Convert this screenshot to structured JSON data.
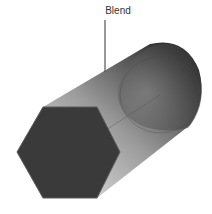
{
  "diagram": {
    "callout_label": "Blend",
    "colors": {
      "background": "#ffffff",
      "hexagon_face": "#3a3a3a",
      "hexagon_edge": "#5a5a5a",
      "body_light": "#c8c8c8",
      "body_dark": "#2e2e2e",
      "leader_line": "#555555",
      "label": "#333333"
    }
  }
}
